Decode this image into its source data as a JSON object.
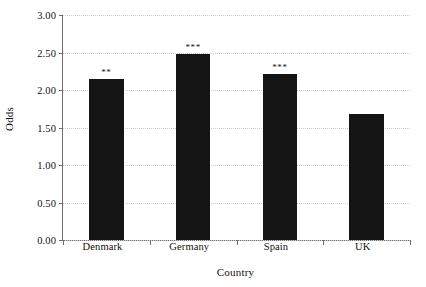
{
  "chart_data": {
    "type": "bar",
    "title": "",
    "xlabel": "Country",
    "ylabel": "Odds",
    "categories": [
      "Denmark",
      "Germany",
      "Spain",
      "UK"
    ],
    "values": [
      2.15,
      2.48,
      2.21,
      1.68
    ],
    "annotations": [
      "**",
      "***",
      "***",
      ""
    ],
    "ylim": [
      0.0,
      3.0
    ],
    "ytick_labels": [
      "0.00",
      "0.50",
      "1.00",
      "1.50",
      "2.00",
      "2.50",
      "3.00"
    ],
    "ytick_values": [
      0.0,
      0.5,
      1.0,
      1.5,
      2.0,
      2.5,
      3.0
    ],
    "grid": true,
    "legend": "none",
    "bar_color": "#141414",
    "grid_color": "#cfcfcf",
    "axis_color": "#6f6f6f"
  }
}
